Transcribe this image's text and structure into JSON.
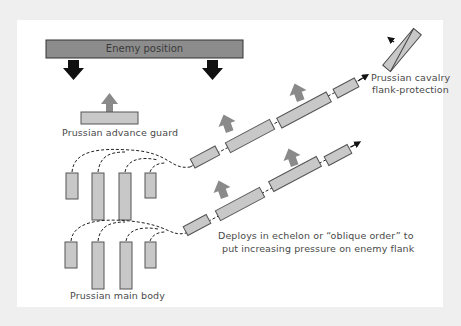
{
  "diagram": {
    "colors": {
      "background": "#efefef",
      "panel": "#ffffff",
      "enemy_bar": "#8c8c8c",
      "unit_fill": "#c8c8c8",
      "unit_stroke": "#555555",
      "advance_arrow": "#8a8a8a",
      "enemy_arrow": "#111111",
      "text": "#4a4a4a"
    },
    "labels": {
      "enemy_position": "Enemy position",
      "advance_guard": "Prussian advance guard",
      "cavalry_line1": "Prussian cavalry",
      "cavalry_line2": "flank-protection",
      "main_body": "Prussian main body",
      "echelon_line1": "Deploys in echelon or “oblique order” to",
      "echelon_line2": "put increasing pressure on enemy flank"
    },
    "elements": {
      "enemy_arrows": 2,
      "main_body_groups": 2,
      "columns_per_group": 4,
      "echelon_lines": 2,
      "blocks_per_echelon_line": 4,
      "advance_arrows_per_line": 2
    }
  }
}
